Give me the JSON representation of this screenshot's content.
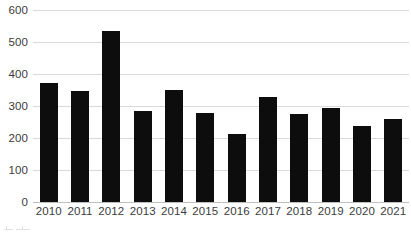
{
  "chart_data": {
    "type": "bar",
    "title": "",
    "subtitle": "",
    "xlabel": "",
    "ylabel": "",
    "categories": [
      "2010",
      "2011",
      "2012",
      "2013",
      "2014",
      "2015",
      "2016",
      "2017",
      "2018",
      "2019",
      "2020",
      "2021"
    ],
    "values": [
      372,
      346,
      533,
      285,
      351,
      278,
      212,
      327,
      274,
      294,
      237,
      258
    ],
    "series": [
      {
        "name": "",
        "values": [
          372,
          346,
          533,
          285,
          351,
          278,
          212,
          327,
          274,
          294,
          237,
          258
        ]
      }
    ],
    "ylim": [
      0,
      600
    ],
    "y_ticks": [
      0,
      100,
      200,
      300,
      400,
      500,
      600
    ],
    "y_tick_labels": [
      "0",
      "100",
      "200",
      "300",
      "400",
      "500",
      "600"
    ],
    "x_tick_labels": [
      "2010",
      "2011",
      "2012",
      "2013",
      "2014",
      "2015",
      "2016",
      "2017",
      "2018",
      "2019",
      "2020",
      "2021"
    ],
    "grid": true,
    "grid_axis": "y",
    "legend": false,
    "legend_position": "none",
    "annotations": [],
    "bar_color": "#0d0d0d",
    "gridline_color": "#d9d9d9",
    "axis_color": "#bfbfbf",
    "tick_label_color": "#3b3b3b",
    "background_color": "#ffffff"
  }
}
